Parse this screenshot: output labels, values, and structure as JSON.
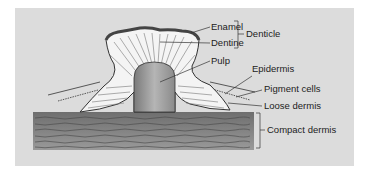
{
  "figure": {
    "type": "anatomical-cross-section",
    "background_color": "#dcdcdc",
    "labels": {
      "enamel": "Enamel",
      "dentine": "Dentine",
      "denticle": "Denticle",
      "pulp": "Pulp",
      "epidermis": "Epidermis",
      "pigment_cells": "Pigment cells",
      "loose_dermis": "Loose dermis",
      "compact_dermis": "Compact dermis"
    },
    "groupings": [
      {
        "bracket": "denticle",
        "members": [
          "enamel",
          "dentine"
        ]
      }
    ]
  }
}
